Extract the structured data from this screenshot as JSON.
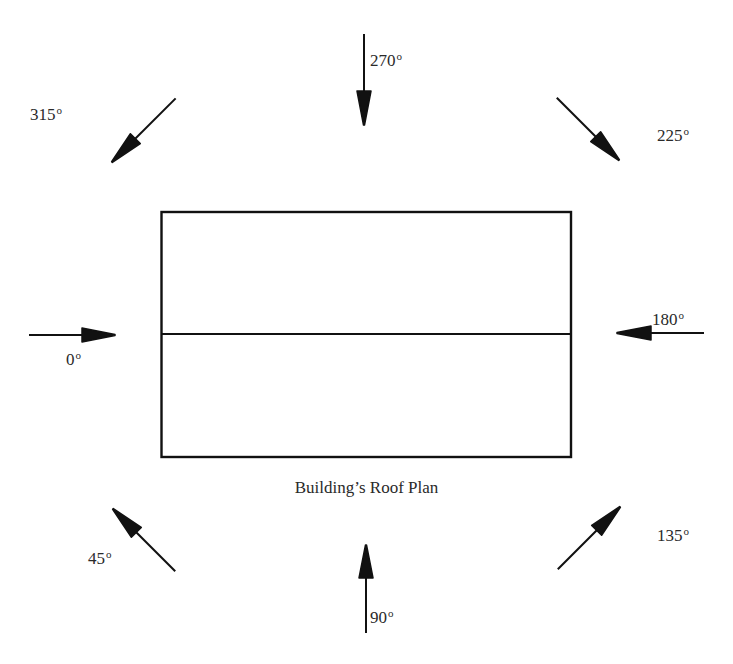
{
  "diagram": {
    "caption": "Building’s Roof Plan",
    "degree_symbol": "o",
    "colors": {
      "line": "#111111",
      "text": "#2a2a2a",
      "background": "#ffffff"
    },
    "roof": {
      "shape": "rectangle",
      "has_ridge_line": true,
      "ridge_orientation": "horizontal"
    },
    "wind_directions": [
      {
        "id": "0",
        "label": "0",
        "position": "left"
      },
      {
        "id": "45",
        "label": "45",
        "position": "bottom-left"
      },
      {
        "id": "90",
        "label": "90",
        "position": "bottom"
      },
      {
        "id": "135",
        "label": "135",
        "position": "bottom-right"
      },
      {
        "id": "180",
        "label": "180",
        "position": "right"
      },
      {
        "id": "225",
        "label": "225",
        "position": "top-right"
      },
      {
        "id": "270",
        "label": "270",
        "position": "top"
      },
      {
        "id": "315",
        "label": "315",
        "position": "top-left"
      }
    ]
  }
}
